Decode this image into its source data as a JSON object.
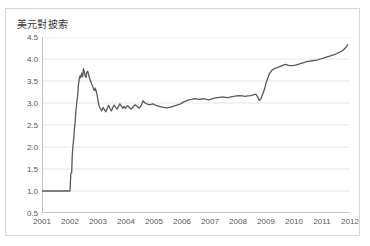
{
  "figure": {
    "background_color": "#ffffff",
    "border_color": "#d8d8d8",
    "title": "美元對披索"
  },
  "chart_data": {
    "type": "line",
    "title": "美元對披索",
    "xlabel": "",
    "ylabel": "",
    "xlim": [
      2001.0,
      2012.0
    ],
    "ylim": [
      0.5,
      4.5
    ],
    "grid": true,
    "grid_axis": "y",
    "legend": false,
    "line_color": "#595959",
    "line_width": 1.3,
    "ytick_labels": [
      "4.5",
      "4.0",
      "3.5",
      "3.0",
      "2.5",
      "2.0",
      "1.5",
      "1.0",
      "0.5"
    ],
    "ytick_values": [
      4.5,
      4.0,
      3.5,
      3.0,
      2.5,
      2.0,
      1.5,
      1.0,
      0.5
    ],
    "xtick_labels": [
      "2001",
      "2002",
      "2003",
      "2004",
      "2005",
      "2006",
      "2007",
      "2008",
      "2009",
      "2010",
      "2011",
      "2012"
    ],
    "xtick_values": [
      2001,
      2002,
      2003,
      2004,
      2005,
      2006,
      2007,
      2008,
      2009,
      2010,
      2011,
      2012
    ],
    "series": [
      {
        "name": "美元對披索",
        "x": [
          2001.0,
          2001.08,
          2001.17,
          2001.25,
          2001.33,
          2001.42,
          2001.5,
          2001.58,
          2001.67,
          2001.75,
          2001.83,
          2001.92,
          2001.97,
          2002.0,
          2002.03,
          2002.06,
          2002.08,
          2002.1,
          2002.12,
          2002.15,
          2002.18,
          2002.21,
          2002.24,
          2002.27,
          2002.3,
          2002.33,
          2002.36,
          2002.39,
          2002.42,
          2002.45,
          2002.48,
          2002.51,
          2002.54,
          2002.57,
          2002.6,
          2002.63,
          2002.66,
          2002.69,
          2002.72,
          2002.75,
          2002.78,
          2002.81,
          2002.84,
          2002.87,
          2002.9,
          2002.93,
          2002.96,
          2002.99,
          2003.03,
          2003.08,
          2003.13,
          2003.18,
          2003.23,
          2003.28,
          2003.33,
          2003.38,
          2003.43,
          2003.48,
          2003.53,
          2003.58,
          2003.63,
          2003.68,
          2003.73,
          2003.78,
          2003.83,
          2003.88,
          2003.93,
          2003.98,
          2004.05,
          2004.12,
          2004.19,
          2004.26,
          2004.33,
          2004.4,
          2004.47,
          2004.54,
          2004.61,
          2004.68,
          2004.75,
          2004.82,
          2004.89,
          2004.96,
          2005.05,
          2005.15,
          2005.25,
          2005.35,
          2005.45,
          2005.55,
          2005.65,
          2005.75,
          2005.85,
          2005.95,
          2006.05,
          2006.15,
          2006.25,
          2006.35,
          2006.45,
          2006.55,
          2006.65,
          2006.75,
          2006.85,
          2006.95,
          2007.05,
          2007.15,
          2007.25,
          2007.35,
          2007.45,
          2007.55,
          2007.65,
          2007.75,
          2007.85,
          2007.95,
          2008.05,
          2008.15,
          2008.25,
          2008.35,
          2008.45,
          2008.52,
          2008.58,
          2008.64,
          2008.7,
          2008.76,
          2008.82,
          2008.88,
          2008.94,
          2009.0,
          2009.06,
          2009.12,
          2009.18,
          2009.24,
          2009.3,
          2009.38,
          2009.46,
          2009.54,
          2009.62,
          2009.7,
          2009.78,
          2009.86,
          2009.94,
          2010.05,
          2010.15,
          2010.25,
          2010.35,
          2010.45,
          2010.55,
          2010.65,
          2010.75,
          2010.85,
          2010.95,
          2011.05,
          2011.15,
          2011.25,
          2011.35,
          2011.45,
          2011.55,
          2011.65,
          2011.75,
          2011.85,
          2011.92
        ],
        "values": [
          1.0,
          1.0,
          1.0,
          1.0,
          1.0,
          1.0,
          1.0,
          1.0,
          1.0,
          1.0,
          1.0,
          1.0,
          1.0,
          1.0,
          1.4,
          1.42,
          1.8,
          2.0,
          2.1,
          2.35,
          2.55,
          2.8,
          3.0,
          3.15,
          3.4,
          3.55,
          3.62,
          3.58,
          3.68,
          3.6,
          3.78,
          3.7,
          3.62,
          3.58,
          3.7,
          3.72,
          3.66,
          3.58,
          3.52,
          3.48,
          3.42,
          3.38,
          3.32,
          3.28,
          3.34,
          3.28,
          3.2,
          3.1,
          2.95,
          2.88,
          2.82,
          2.9,
          2.85,
          2.8,
          2.88,
          2.95,
          2.88,
          2.82,
          2.9,
          2.95,
          2.9,
          2.86,
          2.92,
          2.98,
          2.94,
          2.88,
          2.92,
          2.88,
          2.94,
          2.9,
          2.86,
          2.92,
          2.96,
          2.92,
          2.88,
          2.94,
          3.05,
          3.0,
          2.98,
          2.96,
          2.97,
          2.98,
          2.95,
          2.93,
          2.91,
          2.9,
          2.89,
          2.9,
          2.92,
          2.94,
          2.96,
          2.98,
          3.02,
          3.05,
          3.07,
          3.08,
          3.1,
          3.09,
          3.08,
          3.1,
          3.09,
          3.07,
          3.09,
          3.11,
          3.12,
          3.13,
          3.14,
          3.13,
          3.12,
          3.14,
          3.15,
          3.16,
          3.17,
          3.16,
          3.15,
          3.16,
          3.17,
          3.18,
          3.19,
          3.2,
          3.14,
          3.06,
          3.1,
          3.2,
          3.3,
          3.45,
          3.56,
          3.66,
          3.72,
          3.76,
          3.78,
          3.8,
          3.82,
          3.84,
          3.86,
          3.88,
          3.86,
          3.85,
          3.85,
          3.86,
          3.88,
          3.9,
          3.92,
          3.94,
          3.95,
          3.96,
          3.97,
          3.98,
          4.0,
          4.02,
          4.04,
          4.06,
          4.08,
          4.1,
          4.13,
          4.16,
          4.2,
          4.26,
          4.33
        ]
      }
    ]
  }
}
